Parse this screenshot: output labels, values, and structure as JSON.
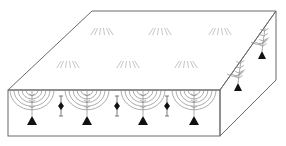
{
  "diagram": {
    "title": "",
    "colors": {
      "outline": "#6a6a6a",
      "arc": "#8a8a8a",
      "node": "#111111",
      "surface_mark": "#b5b5b5"
    },
    "box": {
      "back_left": [
        92,
        11
      ],
      "back_right": [
        276,
        11
      ],
      "front_top_left": [
        8,
        90
      ],
      "front_top_right": [
        220,
        90
      ],
      "front_bottom_left": [
        8,
        136
      ],
      "front_bottom_right": [
        220,
        136
      ],
      "side_bottom_back": [
        276,
        80
      ]
    },
    "front_nodes": [
      {
        "x": 32,
        "y": 122
      },
      {
        "x": 87,
        "y": 122
      },
      {
        "x": 143,
        "y": 122
      },
      {
        "x": 194,
        "y": 122
      }
    ],
    "front_markers": [
      {
        "x": 61,
        "y": 106
      },
      {
        "x": 117,
        "y": 106
      },
      {
        "x": 167,
        "y": 106
      }
    ],
    "side_nodes": [
      {
        "x": 262,
        "y": 56
      },
      {
        "x": 238,
        "y": 88
      }
    ],
    "surface_marks": [
      {
        "x": 102,
        "y": 32
      },
      {
        "x": 160,
        "y": 32
      },
      {
        "x": 220,
        "y": 32
      },
      {
        "x": 68,
        "y": 65
      },
      {
        "x": 128,
        "y": 65
      },
      {
        "x": 186,
        "y": 65
      }
    ]
  }
}
